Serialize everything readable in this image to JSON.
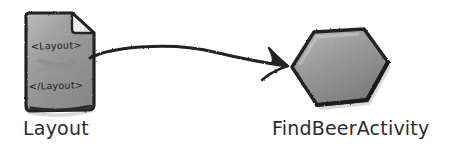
{
  "diagram": {
    "background_color": "#ffffff",
    "ink_color": "#232323",
    "nodes": [
      {
        "id": "layout",
        "shape": "document-page-folded-corner",
        "label": "Layout",
        "fill_color": "#9a9a9a",
        "contents": [
          "<Layout>",
          "</Layout>"
        ]
      },
      {
        "id": "findbeeractivity",
        "shape": "hexagon",
        "label": "FindBeerActivity",
        "fill_color": "#8f8f8f"
      }
    ],
    "connector": {
      "style": "hand-drawn-curved-arrow",
      "from": "layout",
      "to": "findbeeractivity",
      "arrowhead": "two-barb"
    }
  }
}
